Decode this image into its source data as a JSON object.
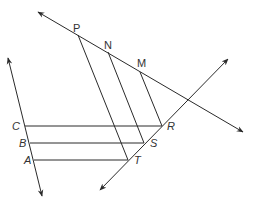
{
  "diagram": {
    "type": "geometry",
    "points": {
      "P": {
        "label": "P",
        "x": 78,
        "y": 35
      },
      "N": {
        "label": "N",
        "x": 108,
        "y": 52
      },
      "M": {
        "label": "M",
        "x": 140,
        "y": 72
      },
      "C": {
        "label": "C",
        "x": 25,
        "y": 126
      },
      "B": {
        "label": "B",
        "x": 30,
        "y": 143
      },
      "A": {
        "label": "A",
        "x": 34,
        "y": 160
      },
      "R": {
        "label": "R",
        "x": 162,
        "y": 126
      },
      "S": {
        "label": "S",
        "x": 144,
        "y": 143
      },
      "T": {
        "label": "T",
        "x": 128,
        "y": 160
      }
    },
    "lines": [
      {
        "name": "line-PNM",
        "from": [
          38,
          12
        ],
        "to": [
          243,
          132
        ],
        "arrows": "both"
      },
      {
        "name": "line-RST",
        "from": [
          228,
          59
        ],
        "to": [
          100,
          190
        ],
        "arrows": "both"
      },
      {
        "name": "line-CBA",
        "from": [
          8,
          58
        ],
        "to": [
          42,
          196
        ],
        "arrows": "both"
      }
    ],
    "segments": [
      {
        "name": "segment-CR",
        "from": "C",
        "to": "R"
      },
      {
        "name": "segment-BS",
        "from": "B",
        "to": "S"
      },
      {
        "name": "segment-AT",
        "from": "A",
        "to": "T"
      },
      {
        "name": "segment-PT",
        "from": "P",
        "to": "T"
      },
      {
        "name": "segment-NS",
        "from": "N",
        "to": "S"
      },
      {
        "name": "segment-MR",
        "from": "M",
        "to": "R"
      }
    ],
    "stroke_color": "#2a2a2a"
  }
}
